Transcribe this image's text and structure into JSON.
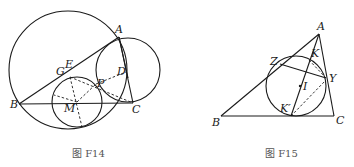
{
  "figures": [
    {
      "caption": "图 F14",
      "labels": {
        "A": "A",
        "B": "B",
        "C": "C",
        "D": "D",
        "E": "E",
        "G": "G",
        "P": "P",
        "M": "M"
      }
    },
    {
      "caption": "图 F15",
      "labels": {
        "A": "A",
        "B": "B",
        "C": "C",
        "Z": "Z",
        "Y": "Y",
        "K": "K",
        "I": "I",
        "Kp": "K′"
      }
    }
  ],
  "colors": {
    "ink": "#1a1a1a",
    "caption": "#555555",
    "background": "#ffffff"
  }
}
